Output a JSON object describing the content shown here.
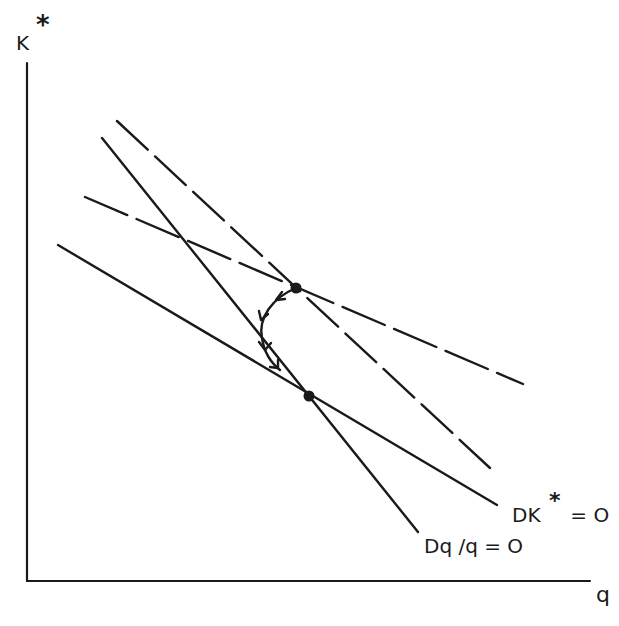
{
  "diagram": {
    "type": "phase-diagram",
    "axes": {
      "y_label": "K",
      "y_label_superscript": "*",
      "x_label": "q"
    },
    "curves": [
      {
        "id": "dk-star-zero",
        "label_main": "DK",
        "label_sup": "*",
        "label_rest": " = O",
        "style": "solid"
      },
      {
        "id": "dq-over-q-zero",
        "label": "Dq /q = O",
        "style": "solid"
      },
      {
        "id": "shifted-steep",
        "label": "",
        "style": "dashed"
      },
      {
        "id": "shifted-flat",
        "label": "",
        "style": "dashed"
      }
    ],
    "points": [
      {
        "id": "new-equilibrium",
        "description": "intersection of dashed loci"
      },
      {
        "id": "old-equilibrium",
        "description": "intersection of DK*=0 and Dq/q=0"
      }
    ],
    "path": {
      "id": "adjustment-path",
      "description": "curved arrowed trajectory from upper equilibrium toward lower equilibrium",
      "arrows": 3
    },
    "colors": {
      "ink": "#1a1a1a",
      "background": "#ffffff"
    }
  }
}
